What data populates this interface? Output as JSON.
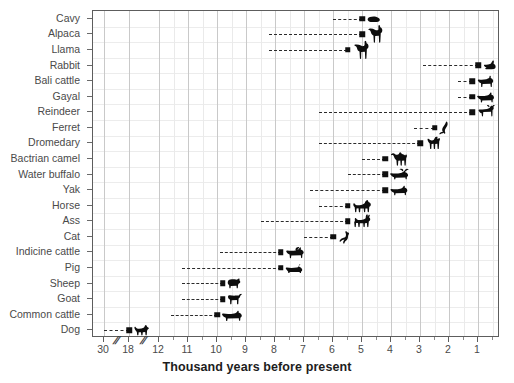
{
  "chart_data": {
    "type": "scatter",
    "title": "",
    "xlabel": "Thousand years before present",
    "ylabel": "",
    "orientation": "horizontal",
    "note": "Domestication dates of animal species. Each row is a species with a dashed line spanning the uncertainty/range and a square marker at the estimated domestication date, followed by a silhouette of the animal.",
    "x_axis": {
      "tick_labels": [
        "30",
        "18",
        "12",
        "11",
        "10",
        "9",
        "8",
        "7",
        "6",
        "5",
        "4",
        "3",
        "2",
        "1"
      ],
      "broken": true,
      "break_positions": [
        "between 30 and 18",
        "between 18 and 12"
      ],
      "minor_ticks": true,
      "direction": "descending-right",
      "units": "thousand years before present"
    },
    "grid": {
      "vertical_major": true,
      "vertical_minor": true,
      "horizontal": true
    },
    "categories": [
      "Cavy",
      "Alpaca",
      "Llama",
      "Rabbit",
      "Bali cattle",
      "Gayal",
      "Reindeer",
      "Ferret",
      "Dromedary",
      "Bactrian camel",
      "Water buffalo",
      "Yak",
      "Horse",
      "Ass",
      "Cat",
      "Indicine cattle",
      "Pig",
      "Sheep",
      "Goat",
      "Common cattle",
      "Dog"
    ],
    "points": [
      {
        "species": "Cavy",
        "value": 5.0,
        "range_start": 6.0,
        "glyph": "cavy-silhouette"
      },
      {
        "species": "Alpaca",
        "value": 5.0,
        "range_start": 8.2,
        "glyph": "alpaca-silhouette"
      },
      {
        "species": "Llama",
        "value": 5.5,
        "range_start": 8.2,
        "glyph": "llama-silhouette"
      },
      {
        "species": "Rabbit",
        "value": 1.0,
        "range_start": 2.9,
        "glyph": "rabbit-silhouette"
      },
      {
        "species": "Bali cattle",
        "value": 1.2,
        "range_start": 1.7,
        "glyph": "bali-cattle-silhouette"
      },
      {
        "species": "Gayal",
        "value": 1.2,
        "range_start": 1.7,
        "glyph": "gayal-silhouette"
      },
      {
        "species": "Reindeer",
        "value": 1.2,
        "range_start": 6.5,
        "glyph": "reindeer-silhouette"
      },
      {
        "species": "Ferret",
        "value": 2.5,
        "range_start": 3.2,
        "glyph": "ferret-silhouette"
      },
      {
        "species": "Dromedary",
        "value": 3.0,
        "range_start": 6.5,
        "glyph": "dromedary-silhouette"
      },
      {
        "species": "Bactrian camel",
        "value": 4.2,
        "range_start": 5.0,
        "glyph": "bactrian-camel-silhouette"
      },
      {
        "species": "Water buffalo",
        "value": 4.2,
        "range_start": 5.5,
        "glyph": "water-buffalo-silhouette"
      },
      {
        "species": "Yak",
        "value": 4.2,
        "range_start": 6.8,
        "glyph": "yak-silhouette"
      },
      {
        "species": "Horse",
        "value": 5.5,
        "range_start": 6.5,
        "glyph": "horse-silhouette"
      },
      {
        "species": "Ass",
        "value": 5.5,
        "range_start": 8.5,
        "glyph": "ass-silhouette"
      },
      {
        "species": "Cat",
        "value": 6.0,
        "range_start": 7.0,
        "glyph": "cat-silhouette"
      },
      {
        "species": "Indicine cattle",
        "value": 7.8,
        "range_start": 9.9,
        "glyph": "indicine-cattle-silhouette"
      },
      {
        "species": "Pig",
        "value": 7.8,
        "range_start": 11.2,
        "glyph": "pig-silhouette"
      },
      {
        "species": "Sheep",
        "value": 9.8,
        "range_start": 11.2,
        "glyph": "sheep-silhouette"
      },
      {
        "species": "Goat",
        "value": 9.8,
        "range_start": 11.2,
        "glyph": "goat-silhouette"
      },
      {
        "species": "Common cattle",
        "value": 10.0,
        "range_start": 11.6,
        "glyph": "common-cattle-silhouette"
      },
      {
        "species": "Dog",
        "value": 18.0,
        "range_start": 30.0,
        "glyph": "dog-silhouette"
      }
    ]
  },
  "axis_break_marks": [
    "//",
    "//"
  ],
  "colors": {
    "marker": "#101010",
    "dash_line": "#2b2b2b",
    "grid_major": "#c9c9c9",
    "grid_minor": "#eaeaea",
    "frame": "#5d5d5d",
    "label_text": "#4a4a4a",
    "title_text": "#1d1d1d"
  }
}
